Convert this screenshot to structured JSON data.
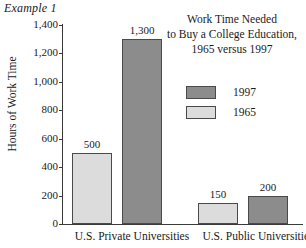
{
  "example_label": "Example 1",
  "chart_title_lines": [
    "Work Time Needed",
    "to Buy a College Education,",
    "1965 versus 1997"
  ],
  "legend": {
    "position": "inside-top-right",
    "entries": [
      {
        "label": "1997",
        "color": "#8c8c8c"
      },
      {
        "label": "1965",
        "color": "#dcdcdc"
      }
    ]
  },
  "axes": {
    "ylabel": "Hours of Work Time",
    "xlabel": "",
    "ylim": [
      0,
      1400
    ],
    "ytick_step": 200,
    "yticks": [
      "0",
      "200",
      "400",
      "600",
      "800",
      "1,000",
      "1,200",
      "1,400"
    ],
    "grid": false
  },
  "colors": {
    "series_1997": "#8c8c8c",
    "series_1965": "#dcdcdc",
    "bar_outline": "#4a4a4a",
    "axis": "#3a3a3a",
    "text": "#1a1a1a",
    "background": "#ffffff"
  },
  "chart_data": {
    "type": "bar",
    "xlabel": "",
    "ylabel": "Hours of Work Time",
    "ylim": [
      0,
      1400
    ],
    "ytick_step": 200,
    "grid": false,
    "legend_position": "inside-top-right",
    "categories": [
      "U.S. Private Universities",
      "U.S. Public Universities"
    ],
    "series": [
      {
        "name": "1965",
        "color": "#dcdcdc",
        "values": [
          500,
          150
        ]
      },
      {
        "name": "1997",
        "color": "#8c8c8c",
        "values": [
          1300,
          200
        ]
      }
    ],
    "bars": [
      {
        "category": "U.S. Private Universities",
        "series": "1965",
        "value": 500,
        "label": "500"
      },
      {
        "category": "U.S. Private Universities",
        "series": "1997",
        "value": 1300,
        "label": "1,300"
      },
      {
        "category": "U.S. Public Universities",
        "series": "1965",
        "value": 150,
        "label": "150"
      },
      {
        "category": "U.S. Public Universities",
        "series": "1997",
        "value": 200,
        "label": "200"
      }
    ]
  }
}
